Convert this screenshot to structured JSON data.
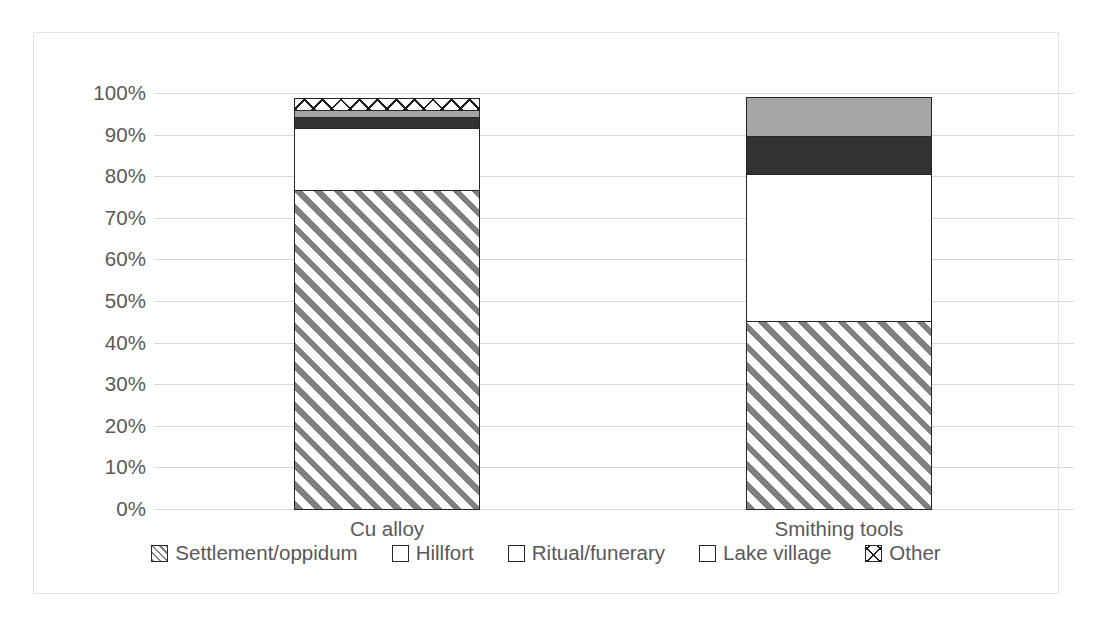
{
  "chart_data": {
    "type": "bar",
    "subtype": "stacked-100-percent",
    "title": "",
    "subtitle": "",
    "xlabel": "",
    "ylabel": "",
    "categories": [
      "Cu alloy",
      "Smithing tools"
    ],
    "series": [
      {
        "name": "Settlement/oppidum",
        "values": [
          77,
          45.5
        ],
        "pattern": "diagonal-hatch",
        "color": "#808080"
      },
      {
        "name": "Hillfort",
        "values": [
          15,
          35.5
        ],
        "pattern": "solid",
        "color": "#ffffff"
      },
      {
        "name": "Ritual/funerary",
        "values": [
          3,
          9.5
        ],
        "pattern": "solid",
        "color": "#333333"
      },
      {
        "name": "Lake village",
        "values": [
          2,
          9.5
        ],
        "pattern": "solid",
        "color": "#a6a6a6"
      },
      {
        "name": "Other",
        "values": [
          3,
          0
        ],
        "pattern": "cross-hatch",
        "color": "#ffffff"
      }
    ],
    "ylim": [
      0,
      100
    ],
    "yticks": [
      "0%",
      "10%",
      "20%",
      "30%",
      "40%",
      "50%",
      "60%",
      "70%",
      "80%",
      "90%",
      "100%"
    ],
    "ytick_values": [
      0,
      10,
      20,
      30,
      40,
      50,
      60,
      70,
      80,
      90,
      100
    ],
    "grid": true,
    "grid_axis": "y",
    "legend_position": "bottom",
    "legend_entries": [
      "Settlement/oppidum",
      "Hillfort",
      "Ritual/funerary",
      "Lake village",
      "Other"
    ],
    "annotations": [],
    "axis_tick_color": "#d9d9d9",
    "text_color": "#595959",
    "frame_color": "#e3e3e3",
    "background": "#ffffff"
  }
}
